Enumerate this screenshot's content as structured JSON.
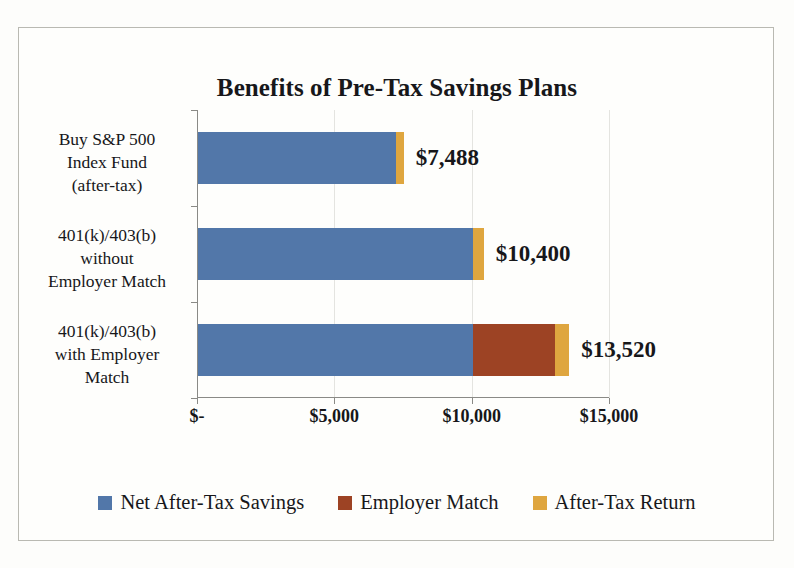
{
  "chart_data": {
    "type": "bar",
    "orientation": "horizontal",
    "stacked": true,
    "title": "Benefits of Pre-Tax Savings Plans",
    "xlabel": "",
    "ylabel": "",
    "xlim": [
      0,
      15000
    ],
    "grid": true,
    "legend_position": "bottom",
    "xticks": [
      0,
      5000,
      10000,
      15000
    ],
    "xticklabels": [
      "$-",
      "$5,000",
      "$10,000",
      "$15,000"
    ],
    "categories": [
      "Buy S&P 500\nIndex Fund\n(after-tax)",
      "401(k)/403(b)\nwithout\nEmployer Match",
      "401(k)/403(b)\nwith Employer\nMatch"
    ],
    "series": [
      {
        "name": "Net After-Tax Savings",
        "color": "#5277A9",
        "values": [
          7200,
          10000,
          10000
        ]
      },
      {
        "name": "Employer Match",
        "color": "#9D4324",
        "values": [
          0,
          0,
          3000
        ]
      },
      {
        "name": "After-Tax Return",
        "color": "#DFA63F",
        "values": [
          288,
          400,
          520
        ]
      }
    ],
    "totals": [
      7488,
      10400,
      13520
    ],
    "total_labels": [
      "$7,488",
      "$10,400",
      "$13,520"
    ]
  },
  "categories": [
    {
      "line1": "Buy S&P 500",
      "line2": "Index Fund",
      "line3": "(after-tax)"
    },
    {
      "line1": "401(k)/403(b)",
      "line2": "without",
      "line3": "Employer Match"
    },
    {
      "line1": "401(k)/403(b)",
      "line2": "with Employer",
      "line3": "Match"
    }
  ],
  "colors": {
    "net_after_tax_savings": "#5277A9",
    "employer_match": "#9D4324",
    "after_tax_return": "#DFA63F",
    "axis": "#8a8a86",
    "grid": "#e4e4e0",
    "text": "#17171a",
    "frame": "#b9b9b2",
    "background": "#fdfdfb"
  }
}
